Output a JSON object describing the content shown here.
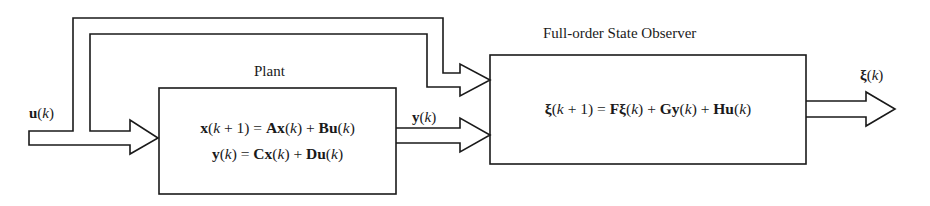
{
  "diagram": {
    "type": "block-diagram",
    "blocks": {
      "plant": {
        "label": "Plant",
        "eq1": {
          "lhs_bold": "x",
          "lhs_rest": "(k + 1) = ",
          "t1_bold": "Ax",
          "t1_rest": "(k) + ",
          "t2_bold": "Bu",
          "t2_rest": "(k)"
        },
        "eq2": {
          "lhs_bold": "y",
          "lhs_rest": "(k) = ",
          "t1_bold": "Cx",
          "t1_rest": "(k) + ",
          "t2_bold": "Du",
          "t2_rest": "(k)"
        }
      },
      "observer": {
        "label": "Full-order State Observer",
        "eq": {
          "lhs_bold": "ξ",
          "lhs_rest": "(k + 1) = ",
          "t1_bold": "Fξ",
          "t1_rest": "(k) + ",
          "t2_bold": "Gy",
          "t2_rest": "(k) + ",
          "t3_bold": "Hu",
          "t3_rest": "(k)"
        }
      }
    },
    "signals": {
      "input": {
        "bold": "u",
        "rest": "(k)"
      },
      "plant_output": {
        "bold": "y",
        "rest": "(k)"
      },
      "observer_output": {
        "bold": "ξ",
        "rest": "(k)"
      }
    },
    "colors": {
      "line": "#1a1a1a",
      "background": "#ffffff"
    }
  }
}
